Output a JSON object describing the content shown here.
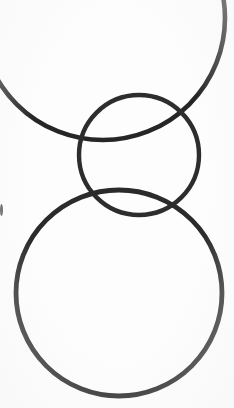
{
  "scene": {
    "title": "Three overlapping circular rings",
    "width": 234,
    "height": 408,
    "background_color": "#fdfdfd",
    "stroke_color": "#2b2b2b",
    "medium": "scanned line drawing"
  },
  "shapes": [
    {
      "name": "top-ring",
      "label": "Large upper ring (cropped by frame)",
      "cx": 103,
      "cy": 18,
      "r": 122,
      "stroke_width": 4.6,
      "stroke_color": "#262626",
      "clipped": "top-and-left-edges"
    },
    {
      "name": "middle-ring",
      "label": "Small middle ring",
      "cx": 139,
      "cy": 155,
      "r": 60,
      "stroke_width": 4.4,
      "stroke_color": "#2d2d2d",
      "clipped": "none"
    },
    {
      "name": "bottom-ring",
      "label": "Large lower ring",
      "cx": 119,
      "cy": 293,
      "r": 103,
      "stroke_width": 4.8,
      "stroke_color": "#2b2b2b",
      "clipped": "none"
    }
  ],
  "artifacts": [
    {
      "name": "left-edge-speck",
      "label": "Small dark scan mark at left border",
      "x": 0,
      "y": 204,
      "width": 3,
      "height": 12,
      "color": "#3a3a3a"
    }
  ],
  "chart_data": {
    "type": "scatter",
    "title": "Three overlapping circular rings",
    "xlabel": "",
    "ylabel": "",
    "xlim": [
      0,
      234
    ],
    "ylim": [
      0,
      408
    ],
    "grid": false,
    "legend": "none",
    "categories": [
      "top-ring",
      "middle-ring",
      "bottom-ring"
    ],
    "series": [
      {
        "name": "center_x",
        "values": [
          103,
          139,
          119
        ]
      },
      {
        "name": "center_y",
        "values": [
          18,
          155,
          293
        ]
      },
      {
        "name": "radius",
        "values": [
          122,
          60,
          103
        ]
      },
      {
        "name": "stroke_width",
        "values": [
          4.6,
          4.4,
          4.8
        ]
      }
    ],
    "annotations": [
      "top ring intersects middle ring near (185, 112) and (79, 150)",
      "middle ring intersects bottom ring near (74, 196) and (197, 200)",
      "top ring is cropped by the top and left image borders"
    ]
  }
}
